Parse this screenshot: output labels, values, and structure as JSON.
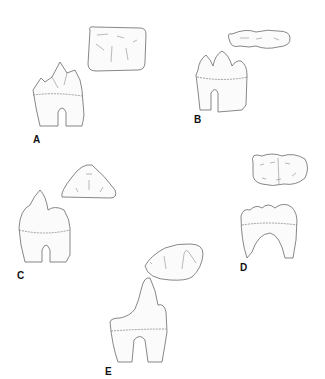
{
  "figure": {
    "panels": [
      {
        "id": "A",
        "label": "A",
        "description": "Tooth with multiple sharp cusps, lateral view and occlusal outline (rectangular)"
      },
      {
        "id": "B",
        "label": "B",
        "description": "Tooth with three cusps in a row, lateral view and occlusal outline (trilobed)"
      },
      {
        "id": "C",
        "label": "C",
        "description": "Tooth with three cusps in triangle, lateral view and occlusal outline (triangular)"
      },
      {
        "id": "D",
        "label": "D",
        "description": "Tooth with rounded low cusps, lateral view and occlusal outline (multi-lobed)"
      },
      {
        "id": "E",
        "label": "E",
        "description": "Tooth with one tall cusp and lower cusps, lateral view and occlusal outline (triangular-oval)"
      }
    ]
  },
  "colors": {
    "line": "#555555",
    "background": "#ffffff",
    "label": "#111111"
  }
}
